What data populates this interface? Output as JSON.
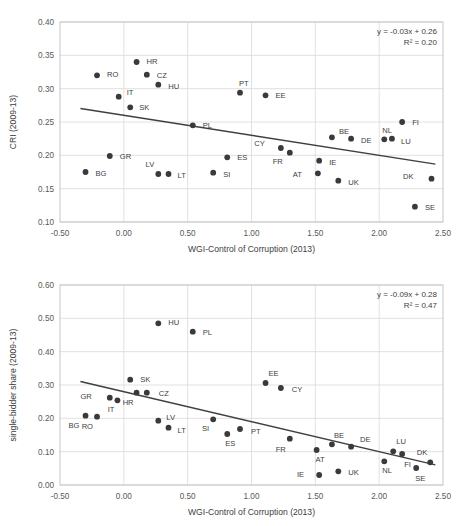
{
  "figure": {
    "background_color": "#ffffff",
    "marker_color": "#3a3a3a",
    "trendline_color": "#3f3f3f",
    "gridline_color": "#d9d9d9"
  },
  "chart_data": [
    {
      "type": "scatter",
      "title": "",
      "xlabel": "WGI-Control of Corruption (2013)",
      "ylabel": "CRI (2009-13)",
      "xlim": [
        -0.5,
        2.5
      ],
      "ylim": [
        0.1,
        0.4
      ],
      "xticks": [
        "-0.50",
        "0.00",
        "0.50",
        "1.00",
        "1.50",
        "2.00",
        "2.50"
      ],
      "xtick_values": [
        -0.5,
        0.0,
        0.5,
        1.0,
        1.5,
        2.0,
        2.5
      ],
      "yticks": [
        "0.10",
        "0.15",
        "0.20",
        "0.25",
        "0.30",
        "0.35",
        "0.40"
      ],
      "ytick_values": [
        0.1,
        0.15,
        0.2,
        0.25,
        0.3,
        0.35,
        0.4
      ],
      "grid": true,
      "legend": "none",
      "annotation_line1": "y = -0.03x + 0.26",
      "annotation_line2": "R² = 0.20",
      "trendline": {
        "slope": -0.03,
        "intercept": 0.26,
        "x_start": -0.34,
        "x_end": 2.44
      },
      "points": [
        {
          "label": "BG",
          "x": -0.3,
          "y": 0.175,
          "lx": 10,
          "ly": 4
        },
        {
          "label": "RO",
          "x": -0.21,
          "y": 0.32,
          "lx": 10,
          "ly": 2
        },
        {
          "label": "GR",
          "x": -0.11,
          "y": 0.199,
          "lx": 10,
          "ly": 3
        },
        {
          "label": "IT",
          "x": -0.04,
          "y": 0.288,
          "lx": 8,
          "ly": -2
        },
        {
          "label": "SK",
          "x": 0.05,
          "y": 0.272,
          "lx": 9,
          "ly": 3
        },
        {
          "label": "HR",
          "x": 0.1,
          "y": 0.34,
          "lx": 10,
          "ly": 2
        },
        {
          "label": "CZ",
          "x": 0.18,
          "y": 0.321,
          "lx": 10,
          "ly": 3
        },
        {
          "label": "HU",
          "x": 0.27,
          "y": 0.306,
          "lx": 10,
          "ly": 4
        },
        {
          "label": "LV",
          "x": 0.27,
          "y": 0.172,
          "lx": -4,
          "ly": -7
        },
        {
          "label": "LT",
          "x": 0.35,
          "y": 0.172,
          "lx": 9,
          "ly": 4
        },
        {
          "label": "PL",
          "x": 0.54,
          "y": 0.245,
          "lx": 10,
          "ly": 3
        },
        {
          "label": "SI",
          "x": 0.7,
          "y": 0.174,
          "lx": 10,
          "ly": 4
        },
        {
          "label": "ES",
          "x": 0.81,
          "y": 0.197,
          "lx": 10,
          "ly": 3
        },
        {
          "label": "PT",
          "x": 0.91,
          "y": 0.294,
          "lx": -1,
          "ly": -7
        },
        {
          "label": "EE",
          "x": 1.11,
          "y": 0.29,
          "lx": 10,
          "ly": 3
        },
        {
          "label": "CY",
          "x": 1.23,
          "y": 0.211,
          "lx": -16,
          "ly": -2
        },
        {
          "label": "FR",
          "x": 1.3,
          "y": 0.204,
          "lx": -7,
          "ly": 11
        },
        {
          "label": "AT",
          "x": 1.52,
          "y": 0.173,
          "lx": -16,
          "ly": 4
        },
        {
          "label": "IE",
          "x": 1.53,
          "y": 0.192,
          "lx": 10,
          "ly": 4
        },
        {
          "label": "BE",
          "x": 1.63,
          "y": 0.227,
          "lx": 7,
          "ly": -3
        },
        {
          "label": "UK",
          "x": 1.68,
          "y": 0.162,
          "lx": 10,
          "ly": 4
        },
        {
          "label": "DE",
          "x": 1.78,
          "y": 0.225,
          "lx": 10,
          "ly": 4
        },
        {
          "label": "NL",
          "x": 2.04,
          "y": 0.224,
          "lx": -2,
          "ly": -6
        },
        {
          "label": "LU",
          "x": 2.1,
          "y": 0.225,
          "lx": 9,
          "ly": 5
        },
        {
          "label": "FI",
          "x": 2.18,
          "y": 0.25,
          "lx": 10,
          "ly": 3
        },
        {
          "label": "SE",
          "x": 2.28,
          "y": 0.123,
          "lx": 10,
          "ly": 3
        },
        {
          "label": "DK",
          "x": 2.41,
          "y": 0.165,
          "lx": -18,
          "ly": 0
        }
      ]
    },
    {
      "type": "scatter",
      "title": "",
      "xlabel": "WGI-Control of Corruption (2013)",
      "ylabel": "single-bidder share (2009-13)",
      "xlim": [
        -0.5,
        2.5
      ],
      "ylim": [
        0.0,
        0.6
      ],
      "xticks": [
        "-0.50",
        "0.00",
        "0.50",
        "1.00",
        "1.50",
        "2.00",
        "2.50"
      ],
      "xtick_values": [
        -0.5,
        0.0,
        0.5,
        1.0,
        1.5,
        2.0,
        2.5
      ],
      "yticks": [
        "0.00",
        "0.10",
        "0.20",
        "0.30",
        "0.40",
        "0.50",
        "0.60"
      ],
      "ytick_values": [
        0.0,
        0.1,
        0.2,
        0.3,
        0.4,
        0.5,
        0.6
      ],
      "grid": true,
      "legend": "none",
      "annotation_line1": "y = -0.09x + 0.28",
      "annotation_line2": "R² = 0.47",
      "trendline": {
        "slope": -0.09,
        "intercept": 0.28,
        "x_start": -0.34,
        "x_end": 2.44
      },
      "points": [
        {
          "label": "BG",
          "x": -0.3,
          "y": 0.208,
          "lx": -6,
          "ly": 12
        },
        {
          "label": "RO",
          "x": -0.21,
          "y": 0.205,
          "lx": -4,
          "ly": 12
        },
        {
          "label": "GR",
          "x": -0.11,
          "y": 0.262,
          "lx": -18,
          "ly": 1
        },
        {
          "label": "IT",
          "x": -0.05,
          "y": 0.254,
          "lx": -3,
          "ly": 12
        },
        {
          "label": "SK",
          "x": 0.05,
          "y": 0.316,
          "lx": 10,
          "ly": 2
        },
        {
          "label": "HR",
          "x": 0.1,
          "y": 0.277,
          "lx": -3,
          "ly": 12
        },
        {
          "label": "CZ",
          "x": 0.18,
          "y": 0.277,
          "lx": 12,
          "ly": 3
        },
        {
          "label": "HU",
          "x": 0.27,
          "y": 0.485,
          "lx": 10,
          "ly": 2
        },
        {
          "label": "LV",
          "x": 0.27,
          "y": 0.193,
          "lx": 8,
          "ly": -1
        },
        {
          "label": "LT",
          "x": 0.35,
          "y": 0.172,
          "lx": 9,
          "ly": 5
        },
        {
          "label": "PL",
          "x": 0.54,
          "y": 0.46,
          "lx": 10,
          "ly": 3
        },
        {
          "label": "SI",
          "x": 0.7,
          "y": 0.197,
          "lx": -4,
          "ly": 12
        },
        {
          "label": "ES",
          "x": 0.81,
          "y": 0.153,
          "lx": -2,
          "ly": 12
        },
        {
          "label": "PT",
          "x": 0.91,
          "y": 0.168,
          "lx": 11,
          "ly": 5
        },
        {
          "label": "EE",
          "x": 1.11,
          "y": 0.306,
          "lx": 3,
          "ly": -7
        },
        {
          "label": "CY",
          "x": 1.23,
          "y": 0.291,
          "lx": 11,
          "ly": 4
        },
        {
          "label": "FR",
          "x": 1.3,
          "y": 0.139,
          "lx": -4,
          "ly": 13
        },
        {
          "label": "AT",
          "x": 1.51,
          "y": 0.105,
          "lx": -1,
          "ly": 12
        },
        {
          "label": "IE",
          "x": 1.53,
          "y": 0.03,
          "lx": -15,
          "ly": 2
        },
        {
          "label": "BE",
          "x": 1.63,
          "y": 0.122,
          "lx": 2,
          "ly": -6
        },
        {
          "label": "UK",
          "x": 1.68,
          "y": 0.041,
          "lx": 10,
          "ly": 4
        },
        {
          "label": "DE",
          "x": 1.78,
          "y": 0.115,
          "lx": 9,
          "ly": -5
        },
        {
          "label": "NL",
          "x": 2.04,
          "y": 0.071,
          "lx": -2,
          "ly": 12
        },
        {
          "label": "LU",
          "x": 2.11,
          "y": 0.101,
          "lx": 3,
          "ly": -7
        },
        {
          "label": "FI",
          "x": 2.18,
          "y": 0.093,
          "lx": 2,
          "ly": 13
        },
        {
          "label": "SE",
          "x": 2.29,
          "y": 0.051,
          "lx": -1,
          "ly": 13
        },
        {
          "label": "DK",
          "x": 2.4,
          "y": 0.068,
          "lx": -3,
          "ly": -7
        }
      ]
    }
  ]
}
